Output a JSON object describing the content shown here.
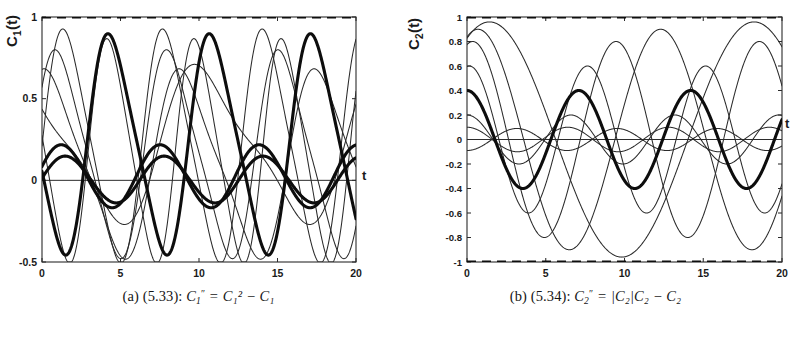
{
  "figure": {
    "panels": [
      {
        "id": "panel-a",
        "axis_label": "C",
        "axis_label_sub": "1",
        "axis_label_tail": "(t)",
        "x_axis_label": "t",
        "caption": {
          "tag": "(a)",
          "eq_number": "(5.33):",
          "lhs_var": "C",
          "lhs_sub": "1",
          "lhs_prime": "″",
          "eq": "=",
          "rhs": "C₁² − C₁",
          "rhs_terms": [
            {
              "var": "C",
              "sub": "1",
              "sup": "2"
            },
            {
              "op": "−"
            },
            {
              "var": "C",
              "sub": "1",
              "sup": ""
            }
          ]
        },
        "chart_data": {
          "type": "line",
          "title": "",
          "xlabel": "t",
          "ylabel": "C_1(t)",
          "xlim": [
            0,
            20
          ],
          "ylim": [
            -0.5,
            1.0
          ],
          "xticks": [
            0,
            5,
            10,
            15,
            20
          ],
          "xticklabels": [
            "0",
            "5",
            "10",
            "15",
            "20"
          ],
          "yticks": [
            -0.5,
            0,
            0.5,
            1
          ],
          "yticklabels": [
            "-0.5",
            "0",
            "0.5",
            "1"
          ],
          "grid": false,
          "legend": "none",
          "annotations": [
            "dashed equilibrium line at C_1 = 1",
            "solid zero line at C_1 = 0"
          ],
          "series": [
            {
              "name": "equilibrium-upper",
              "style": "dashed",
              "lw": "thick",
              "kind": "const",
              "level": 1.0
            },
            {
              "name": "zero-line",
              "style": "solid",
              "lw": "hair",
              "kind": "const",
              "level": 0.0
            },
            {
              "name": "orbit-1",
              "style": "solid",
              "lw": "thin",
              "kind": "osc",
              "amp": 0.74,
              "period": 6.35,
              "phase": 0.0,
              "offset": 0.21,
              "sharp": 0.3
            },
            {
              "name": "orbit-2",
              "style": "solid",
              "lw": "thin",
              "kind": "osc",
              "amp": 0.66,
              "period": 7.1,
              "phase": 0.55,
              "offset": 0.16,
              "sharp": 0.34
            },
            {
              "name": "orbit-3",
              "style": "solid",
              "lw": "thin",
              "kind": "osc",
              "amp": 0.6,
              "period": 8.6,
              "phase": 1.15,
              "offset": 0.1,
              "sharp": 0.4
            },
            {
              "name": "orbit-4",
              "style": "solid",
              "lw": "thin",
              "kind": "osc",
              "amp": 0.5,
              "period": 11.8,
              "phase": 2.3,
              "offset": 0.22,
              "sharp": 0.52
            },
            {
              "name": "orbit-5",
              "style": "solid",
              "lw": "thin",
              "kind": "osc",
              "amp": 0.71,
              "period": 5.55,
              "phase": 2.95,
              "offset": 0.18,
              "sharp": 0.26
            },
            {
              "name": "orbit-6",
              "style": "solid",
              "lw": "thick",
              "kind": "osc",
              "amp": 0.7,
              "period": 6.45,
              "phase": 3.5,
              "offset": 0.22,
              "sharp": 0.3
            },
            {
              "name": "orbit-7",
              "style": "solid",
              "lw": "thick",
              "kind": "osc",
              "amp": 0.195,
              "period": 6.3,
              "phase": 0.3,
              "offset": 0.025,
              "sharp": 0.05
            },
            {
              "name": "orbit-8",
              "style": "solid",
              "lw": "thick",
              "kind": "osc",
              "amp": 0.145,
              "period": 6.3,
              "phase": 0.05,
              "offset": 0.005,
              "sharp": 0.05
            }
          ]
        }
      },
      {
        "id": "panel-b",
        "axis_label": "C",
        "axis_label_sub": "2",
        "axis_label_tail": "(t)",
        "x_axis_label": "t",
        "caption": {
          "tag": "(b)",
          "eq_number": "(5.34):",
          "lhs_var": "C",
          "lhs_sub": "2",
          "lhs_prime": "″",
          "eq": "=",
          "rhs": "|C₂|C₂ − C₂",
          "rhs_terms": [
            {
              "abs": "|C₂|"
            },
            {
              "var": "C",
              "sub": "2",
              "sup": ""
            },
            {
              "op": "−"
            },
            {
              "var": "C",
              "sub": "2",
              "sup": ""
            }
          ]
        },
        "chart_data": {
          "type": "line",
          "title": "",
          "xlabel": "t",
          "ylabel": "C_2(t)",
          "xlim": [
            0,
            20
          ],
          "ylim": [
            -1.0,
            1.0
          ],
          "xticks": [
            0,
            5,
            10,
            15,
            20
          ],
          "xticklabels": [
            "0",
            "5",
            "10",
            "15",
            "20"
          ],
          "yticks": [
            -1,
            -0.8,
            -0.6,
            -0.4,
            -0.2,
            0,
            0.2,
            0.4,
            0.6,
            0.8,
            1
          ],
          "yticklabels": [
            "-1",
            "-0.8",
            "-0.6",
            "-0.4",
            "-0.2",
            "0",
            "0.2",
            "0.4",
            "0.6",
            "0.8",
            "1"
          ],
          "grid": false,
          "legend": "none",
          "annotations": [
            "dashed line at C_2 = 1",
            "dashed line at C_2 = -1",
            "solid zero line at C_2 = 0"
          ],
          "series": [
            {
              "name": "equilibrium-upper",
              "style": "dashed",
              "lw": "thick",
              "kind": "const",
              "level": 1.0
            },
            {
              "name": "equilibrium-lower",
              "style": "dashed",
              "lw": "thick",
              "kind": "const",
              "level": -1.0
            },
            {
              "name": "zero-line",
              "style": "solid",
              "lw": "hair",
              "kind": "const",
              "level": 0.0
            },
            {
              "name": "orbit-1",
              "style": "solid",
              "lw": "thin",
              "kind": "sin",
              "amp": 0.96,
              "period": 16.8,
              "phase": 0.33,
              "offset": 0.0
            },
            {
              "name": "orbit-2",
              "style": "solid",
              "lw": "thin",
              "kind": "sin",
              "amp": 0.9,
              "period": 11.6,
              "phase": 0.38,
              "offset": 0.0
            },
            {
              "name": "orbit-3",
              "style": "solid",
              "lw": "thin",
              "kind": "sin",
              "amp": 0.8,
              "period": 9.1,
              "phase": 0.42,
              "offset": 0.0
            },
            {
              "name": "orbit-4",
              "style": "solid",
              "lw": "thin",
              "kind": "sin",
              "amp": 0.6,
              "period": 7.5,
              "phase": 0.46,
              "offset": 0.0
            },
            {
              "name": "orbit-5",
              "style": "solid",
              "lw": "thin",
              "kind": "sin",
              "amp": 0.2,
              "period": 6.6,
              "phase": 0.5,
              "offset": 0.0
            },
            {
              "name": "orbit-6",
              "style": "solid",
              "lw": "thin",
              "kind": "sin",
              "amp": 0.1,
              "period": 6.4,
              "phase": 0.5,
              "offset": 0.0
            },
            {
              "name": "orbit-7",
              "style": "solid",
              "lw": "thin",
              "kind": "sin",
              "amp": -0.09,
              "period": 6.35,
              "phase": 0.5,
              "offset": 0.0
            },
            {
              "name": "orbit-8",
              "style": "solid",
              "lw": "thick",
              "kind": "sin",
              "amp": 0.4,
              "period": 7.1,
              "phase": 0.5,
              "offset": 0.0
            }
          ]
        }
      }
    ]
  }
}
